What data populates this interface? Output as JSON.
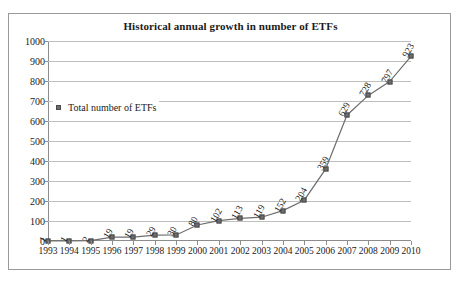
{
  "chart_data": {
    "type": "line",
    "title": "Historical annual growth in number of ETFs",
    "xlabel": "",
    "ylabel": "",
    "ylim": [
      0,
      1000
    ],
    "ytick_step": 100,
    "grid": true,
    "legend_position": "inside-upper-left",
    "categories": [
      "1993",
      "1994",
      "1995",
      "1996",
      "1997",
      "1998",
      "1999",
      "2000",
      "2001",
      "2002",
      "2003",
      "2004",
      "2005",
      "2006",
      "2007",
      "2008",
      "2009",
      "2010"
    ],
    "yticks": [
      "0",
      "100",
      "200",
      "300",
      "400",
      "500",
      "600",
      "700",
      "800",
      "900",
      "1000"
    ],
    "series": [
      {
        "name": "Total number of ETFs",
        "values": [
          1,
          1,
          2,
          19,
          19,
          29,
          30,
          80,
          102,
          113,
          119,
          152,
          204,
          359,
          629,
          728,
          797,
          923
        ],
        "line_color": "#6e6e6e",
        "marker_color": "#6e6e6e"
      }
    ],
    "point_labels": [
      "1",
      "1",
      "2",
      "19",
      "19",
      "29",
      "30",
      "80",
      "102",
      "113",
      "119",
      "152",
      "204",
      "359",
      "629",
      "728",
      "797",
      "923"
    ]
  },
  "legend": {
    "entries": [
      {
        "label": "Total number of ETFs",
        "marker": "square-marker"
      }
    ]
  },
  "colors": {
    "border": "#9a9a9a",
    "axis": "#8d8d8d",
    "grid": "#bfbfbf",
    "series": "#6e6e6e",
    "text": "#1a1a1a"
  }
}
